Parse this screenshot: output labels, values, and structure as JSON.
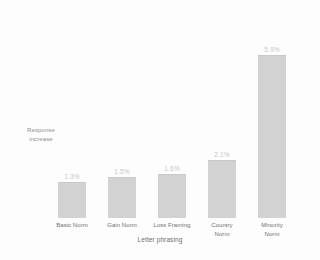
{
  "chart_data": {
    "type": "bar",
    "title": "",
    "subtitle": "",
    "xlabel": "Letter phrasing",
    "ylabel": "Response increase",
    "categories": [
      "Basic Norm",
      "Gain Norm",
      "Loss Framing",
      "Country Norm",
      "Minority Norm"
    ],
    "category_lines": [
      [
        "Basic Norm"
      ],
      [
        "Gain Norm"
      ],
      [
        "Loss Framing"
      ],
      [
        "Country",
        "Norm"
      ],
      [
        "Minority",
        "Norm"
      ]
    ],
    "values": [
      1.3,
      1.5,
      1.6,
      2.1,
      5.9
    ],
    "value_labels": [
      "1.3%",
      "1.5%",
      "1.6%",
      "2.1%",
      "5.9%"
    ],
    "ylim": [
      0,
      6.8
    ],
    "grid": false,
    "legend": false,
    "bar_color": "#d2d2d2",
    "value_label_color": "#c6c6c6",
    "category_label_color": "#6f6f6f",
    "axis_label_color": "#8d8d8d",
    "background_color": "#fdfdfd"
  },
  "axis": {
    "ylabel_line1": "Response",
    "ylabel_line2": "increase",
    "xlabel": "Letter phrasing"
  }
}
